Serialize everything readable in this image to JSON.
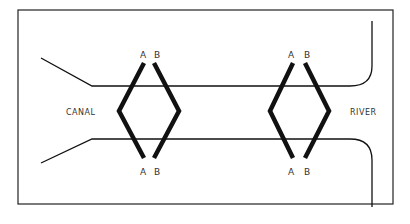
{
  "diagram": {
    "places": {
      "left": "CANAL",
      "right": "RIVER"
    },
    "gates": [
      {
        "id": "left-A",
        "top_label": "A",
        "bottom_label": "A"
      },
      {
        "id": "left-B",
        "top_label": "B",
        "bottom_label": "B"
      },
      {
        "id": "right-A",
        "top_label": "A",
        "bottom_label": "A"
      },
      {
        "id": "right-B",
        "top_label": "B",
        "bottom_label": "B"
      }
    ],
    "colors": {
      "line": "#111111",
      "frame": "#222222",
      "text": "#333333",
      "background": "#ffffff"
    }
  }
}
